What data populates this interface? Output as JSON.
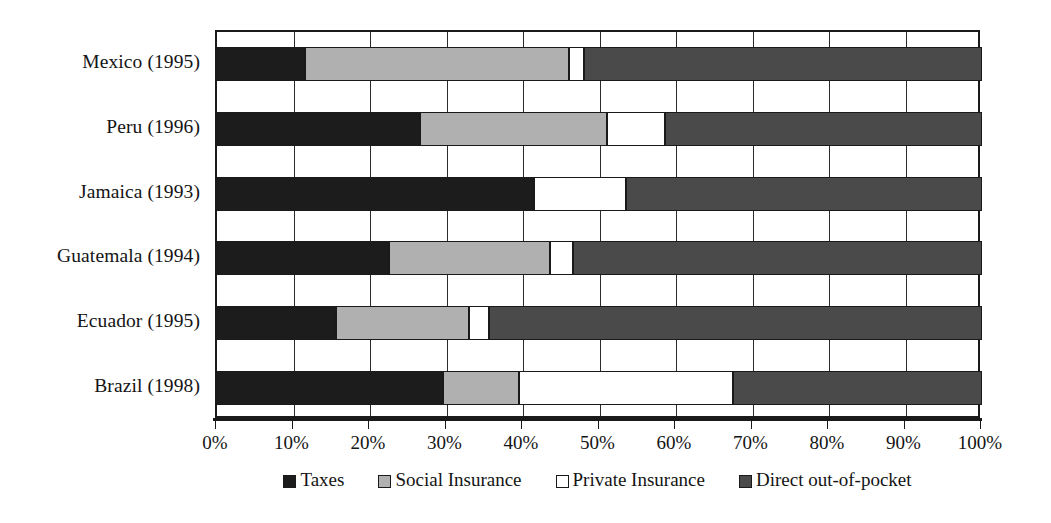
{
  "chart_data": {
    "type": "bar",
    "orientation": "horizontal",
    "stacked": true,
    "title": "",
    "subtitle": "",
    "xlabel": "",
    "ylabel": "",
    "xlim": [
      0,
      100
    ],
    "grid": true,
    "legend_position": "bottom",
    "categories": [
      "Mexico (1995)",
      "Peru (1996)",
      "Jamaica (1993)",
      "Guatemala (1994)",
      "Ecuador (1995)",
      "Brazil (1998)"
    ],
    "tick_labels": [
      "0%",
      "10%",
      "20%",
      "30%",
      "40%",
      "50%",
      "60%",
      "70%",
      "80%",
      "90%",
      "100%"
    ],
    "tick_values": [
      0,
      10,
      20,
      30,
      40,
      50,
      60,
      70,
      80,
      90,
      100
    ],
    "series": [
      {
        "name": "Taxes",
        "color": "#1c1c1c",
        "values": [
          11.5,
          26.5,
          41.5,
          22.5,
          15.5,
          29.5
        ]
      },
      {
        "name": "Social Insurance",
        "color": "#b0b0b0",
        "values": [
          34.5,
          24.5,
          0,
          21.0,
          17.5,
          10.0
        ]
      },
      {
        "name": "Private Insurance",
        "color": "#ffffff",
        "values": [
          2.0,
          7.5,
          12.0,
          3.0,
          2.5,
          28.0
        ]
      },
      {
        "name": "Direct out-of-pocket",
        "color": "#4a4a4a",
        "values": [
          52.0,
          41.5,
          46.5,
          53.5,
          64.5,
          32.5
        ]
      }
    ]
  },
  "legend": {
    "items": [
      {
        "label": "Taxes",
        "swatch": "taxes"
      },
      {
        "label": "Social Insurance",
        "swatch": "social"
      },
      {
        "label": "Private Insurance",
        "swatch": "private"
      },
      {
        "label": "Direct out-of-pocket",
        "swatch": "direct"
      }
    ]
  }
}
